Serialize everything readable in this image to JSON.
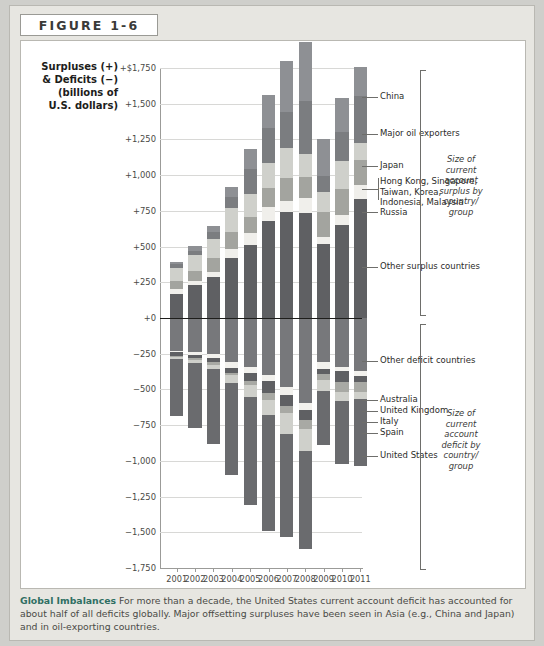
{
  "figure": {
    "header_label": "FIGURE 1-6",
    "axis_title_lines": [
      "Surpluses (+)",
      "& Deficits (−)",
      "(billions of",
      "U.S. dollars)"
    ],
    "caption_bold": "Global Imbalances",
    "caption_text": "For more than a decade, the United States current account deficit has accounted for about half of all deficits globally. Major offsetting surpluses have been seen in Asia (e.g., China and Japan) and in oil-exporting countries."
  },
  "annotations": {
    "surplus_brace": "Size of current account surplus by country/ group",
    "deficit_brace": "Size of current account deficit by country/ group"
  },
  "chart_data": {
    "type": "bar",
    "subtype": "diverging-stacked",
    "title": "Global Imbalances",
    "xlabel": "",
    "ylabel": "Surpluses (+) & Deficits (−) (billions of U.S. dollars)",
    "ylim": [
      -1750,
      1750
    ],
    "ytick_labels": [
      "+$1,750",
      "+1,500",
      "+1,250",
      "+1,000",
      "+750",
      "+500",
      "+250",
      "+0",
      "−250",
      "−500",
      "−750",
      "−1,000",
      "−1,250",
      "−1,500",
      "−1,750"
    ],
    "yticks": [
      1750,
      1500,
      1250,
      1000,
      750,
      500,
      250,
      0,
      -250,
      -500,
      -750,
      -1000,
      -1250,
      -1500,
      -1750
    ],
    "grid": true,
    "legend_position": "right-callouts",
    "categories": [
      "2001",
      "2002",
      "2003",
      "2004",
      "2005",
      "2006",
      "2007",
      "2008",
      "2009",
      "2010",
      "2011"
    ],
    "surplus_series": [
      {
        "name": "Other surplus countries",
        "color": "#5f6063",
        "values": [
          165,
          230,
          290,
          420,
          510,
          680,
          740,
          735,
          515,
          650,
          830
        ]
      },
      {
        "name": "Russia",
        "color": "#f0efeb",
        "values": [
          35,
          30,
          35,
          60,
          85,
          95,
          78,
          105,
          50,
          70,
          98
        ]
      },
      {
        "name": "Hong Kong, Singapore, Taiwan, Korea, Indonesia, Malaysia",
        "color": "#a3a49f",
        "values": [
          60,
          70,
          95,
          120,
          110,
          135,
          160,
          145,
          175,
          185,
          175
        ]
      },
      {
        "name": "Japan",
        "color": "#cfd0cb",
        "values": [
          88,
          112,
          136,
          172,
          166,
          174,
          212,
          160,
          145,
          196,
          120
        ]
      },
      {
        "name": "Major oil exporters",
        "color": "#7b7d80",
        "values": [
          30,
          28,
          45,
          78,
          175,
          245,
          255,
          375,
          110,
          200,
          330
        ]
      },
      {
        "name": "China",
        "color": "#8e9094",
        "values": [
          17,
          35,
          46,
          69,
          134,
          232,
          354,
          412,
          261,
          238,
          202
        ]
      }
    ],
    "deficit_series": [
      {
        "name": "Other deficit countries",
        "color": "#77787b",
        "values": [
          -230,
          -240,
          -250,
          -310,
          -345,
          -400,
          -480,
          -595,
          -310,
          -340,
          -370
        ]
      },
      {
        "name": "Australia",
        "color": "#f2f1ed",
        "values": [
          -8,
          -16,
          -30,
          -40,
          -42,
          -41,
          -58,
          -48,
          -44,
          -32,
          -34
        ]
      },
      {
        "name": "United Kingdom",
        "color": "#5f6063",
        "values": [
          -31,
          -25,
          -28,
          -35,
          -52,
          -82,
          -76,
          -69,
          -37,
          -75,
          -46
        ]
      },
      {
        "name": "Italy",
        "color": "#a8a9a4",
        "values": [
          -1,
          -10,
          -20,
          -16,
          -30,
          -48,
          -52,
          -66,
          -42,
          -72,
          -68
        ]
      },
      {
        "name": "Spain",
        "color": "#cfd0cb",
        "values": [
          -19,
          -23,
          -31,
          -55,
          -83,
          -111,
          -145,
          -154,
          -75,
          -64,
          -52
        ]
      },
      {
        "name": "United States",
        "color": "#6a6b6e",
        "values": [
          -398,
          -459,
          -522,
          -640,
          -755,
          -807,
          -719,
          -687,
          -382,
          -442,
          -466
        ]
      }
    ],
    "callout_labels_surplus": [
      "China",
      "Major oil exporters",
      "Japan",
      "Hong Kong, Singapore, Taiwan, Korea, Indonesia, Malaysia",
      "Russia",
      "Other surplus countries"
    ],
    "callout_labels_deficit": [
      "Other deficit countries",
      "Australia",
      "United Kingdom",
      "Italy",
      "Spain",
      "United States"
    ]
  }
}
